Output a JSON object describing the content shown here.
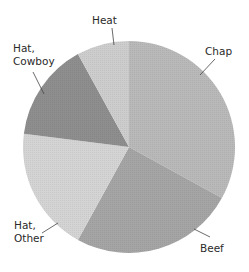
{
  "chart_data": {
    "type": "pie",
    "title": "",
    "start_angle_deg": 0,
    "direction": "clockwise",
    "slices": [
      {
        "label": "Chap",
        "value": 33,
        "color": "#b9b9b9"
      },
      {
        "label": "Beef",
        "value": 25,
        "color": "#a5a5a5"
      },
      {
        "label": "Hat, Other",
        "value": 19,
        "color": "#d4d4d4"
      },
      {
        "label": "Hat, Cowboy",
        "value": 15,
        "color": "#8e8e8e"
      },
      {
        "label": "Heat",
        "value": 8,
        "color": "#cdcdcd"
      }
    ],
    "legend": "none",
    "labels_outside_with_leader_lines": true
  },
  "labels": {
    "chap": "Chap",
    "beef": "Beef",
    "hat_other_line1": "Hat,",
    "hat_other_line2": "Other",
    "hat_cowboy_line1": "Hat,",
    "hat_cowboy_line2": "Cowboy",
    "heat": "Heat"
  }
}
